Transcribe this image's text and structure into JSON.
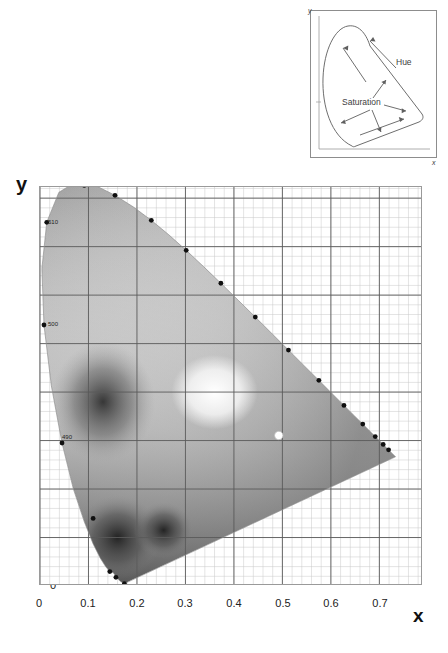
{
  "figure": {
    "kind": "cie-1931-chromaticity-diagram",
    "rendering": "grayscale",
    "background_color": "#ffffff",
    "grid_major_color": "#5a5a5a",
    "grid_minor_color": "#c8c8c8",
    "locus_point_color": "#101010",
    "white_point_color": "#ffffff"
  },
  "inset": {
    "name": "hue-saturation-inset",
    "axis_x_label": "x",
    "axis_y_label": "y",
    "labels": [
      {
        "text": "Hue",
        "x": 86,
        "y": 52
      },
      {
        "text": "Saturation",
        "x": 34,
        "y": 92
      }
    ],
    "border_color": "#8d8d8d",
    "curve_color": "#6e6e6e",
    "arrow_color": "#5f5f5f"
  },
  "main": {
    "x_axis_title": "x",
    "y_axis_title": "y",
    "x_ticks": [
      "0",
      "0.1",
      "0.2",
      "0.3",
      "0.4",
      "0.5",
      "0.6",
      "0.7"
    ],
    "y_ticks": [
      "0",
      "0.1",
      "0.2",
      "0.3",
      "0.4",
      "0.5",
      "0.6",
      "0.7",
      "0.8"
    ],
    "wavelength_labels": [
      {
        "text": "510",
        "x": 0.011,
        "y": 0.75
      },
      {
        "text": "500",
        "x": 0.009,
        "y": 0.54
      },
      {
        "text": "490",
        "x": 0.048,
        "y": 0.31
      }
    ]
  },
  "chart_data": {
    "type": "scatter",
    "title": "",
    "xlabel": "x",
    "ylabel": "y",
    "xlim": [
      0.0,
      0.79
    ],
    "ylim": [
      0.0,
      0.823
    ],
    "grid": true,
    "grid_major_step": 0.1,
    "grid_minor_step": 0.02,
    "legend": "none",
    "series": [
      {
        "name": "spectral-locus-wavelength-markers",
        "marker": "filled-circle",
        "points": [
          {
            "x": 0.0913,
            "y": 0.8265,
            "label": "520"
          },
          {
            "x": 0.1547,
            "y": 0.8059,
            "label": "530"
          },
          {
            "x": 0.2296,
            "y": 0.7543,
            "label": "540"
          },
          {
            "x": 0.3016,
            "y": 0.6923,
            "label": "550"
          },
          {
            "x": 0.3731,
            "y": 0.6245,
            "label": "560"
          },
          {
            "x": 0.4441,
            "y": 0.5547,
            "label": "570"
          },
          {
            "x": 0.5125,
            "y": 0.4866,
            "label": "580"
          },
          {
            "x": 0.5752,
            "y": 0.4242,
            "label": "590"
          },
          {
            "x": 0.627,
            "y": 0.3725,
            "label": "600"
          },
          {
            "x": 0.6658,
            "y": 0.334,
            "label": "610"
          },
          {
            "x": 0.6915,
            "y": 0.3083,
            "label": "620"
          },
          {
            "x": 0.7079,
            "y": 0.292,
            "label": "630"
          },
          {
            "x": 0.719,
            "y": 0.2809,
            "label": "640"
          },
          {
            "x": 0.0082,
            "y": 0.5384,
            "label": "500"
          },
          {
            "x": 0.0139,
            "y": 0.7502,
            "label": "510"
          },
          {
            "x": 0.0454,
            "y": 0.295,
            "label": "490"
          },
          {
            "x": 0.1096,
            "y": 0.1393,
            "label": "480"
          },
          {
            "x": 0.144,
            "y": 0.0297,
            "label": "470"
          },
          {
            "x": 0.1566,
            "y": 0.0178,
            "label": "460"
          },
          {
            "x": 0.1741,
            "y": 0.005,
            "label": "450"
          }
        ]
      },
      {
        "name": "white-point",
        "marker": "open-circle",
        "points": [
          {
            "x": 0.4925,
            "y": 0.3105,
            "label": ""
          }
        ]
      }
    ],
    "locus_outline": [
      [
        0.1741,
        0.005
      ],
      [
        0.1666,
        0.0089
      ],
      [
        0.1611,
        0.0138
      ],
      [
        0.151,
        0.0273
      ],
      [
        0.144,
        0.0297
      ],
      [
        0.1355,
        0.0399
      ],
      [
        0.1241,
        0.0578
      ],
      [
        0.1096,
        0.0868
      ],
      [
        0.0913,
        0.1327
      ],
      [
        0.0687,
        0.2007
      ],
      [
        0.0454,
        0.295
      ],
      [
        0.0235,
        0.4127
      ],
      [
        0.0082,
        0.5384
      ],
      [
        0.0039,
        0.6548
      ],
      [
        0.0139,
        0.7502
      ],
      [
        0.0389,
        0.812
      ],
      [
        0.0743,
        0.8338
      ],
      [
        0.1142,
        0.8262
      ],
      [
        0.1547,
        0.8059
      ],
      [
        0.1929,
        0.7816
      ],
      [
        0.2296,
        0.7543
      ],
      [
        0.2658,
        0.7243
      ],
      [
        0.3016,
        0.6923
      ],
      [
        0.3373,
        0.6589
      ],
      [
        0.3731,
        0.6245
      ],
      [
        0.4087,
        0.5896
      ],
      [
        0.4441,
        0.5547
      ],
      [
        0.4788,
        0.5202
      ],
      [
        0.5125,
        0.4866
      ],
      [
        0.5448,
        0.4544
      ],
      [
        0.5752,
        0.4242
      ],
      [
        0.6029,
        0.3965
      ],
      [
        0.627,
        0.3725
      ],
      [
        0.6482,
        0.3514
      ],
      [
        0.6658,
        0.334
      ],
      [
        0.6801,
        0.3197
      ],
      [
        0.6915,
        0.3083
      ],
      [
        0.7006,
        0.2993
      ],
      [
        0.7079,
        0.292
      ],
      [
        0.714,
        0.2859
      ],
      [
        0.719,
        0.2809
      ],
      [
        0.723,
        0.277
      ],
      [
        0.726,
        0.274
      ],
      [
        0.7334,
        0.2666
      ],
      [
        0.1741,
        0.005
      ]
    ]
  }
}
